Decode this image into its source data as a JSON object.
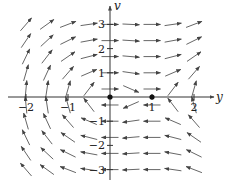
{
  "figure": {
    "type": "phase-plane",
    "x_axis_label": "y",
    "y_axis_label": "v",
    "x_ticks": [
      {
        "value": -2,
        "label": "−2"
      },
      {
        "value": -1,
        "label": "−1"
      },
      {
        "value": 1,
        "label": "1"
      },
      {
        "value": 2,
        "label": "2"
      }
    ],
    "y_ticks": [
      {
        "value": 3,
        "label": "3"
      },
      {
        "value": 2,
        "label": "2"
      },
      {
        "value": 1,
        "label": "1"
      },
      {
        "value": -1,
        "label": "−1"
      },
      {
        "value": -2,
        "label": "−2"
      },
      {
        "value": -3,
        "label": "−3"
      }
    ],
    "equilibria": [
      {
        "y": 0,
        "v": 0
      },
      {
        "y": 1,
        "v": 0
      }
    ],
    "field": {
      "dy": "v",
      "dv": "y*y - y"
    },
    "grid_x": [
      -2,
      -1.5,
      -1,
      -0.5,
      0,
      0.5,
      1,
      1.5,
      2
    ],
    "grid_v": [
      3,
      2.33,
      1.67,
      1,
      0.33,
      -0.33,
      -1,
      -1.67,
      -2.33,
      -3
    ],
    "colors": {
      "axis": "#333333",
      "arrow": "#555555",
      "point": "#111111"
    }
  }
}
